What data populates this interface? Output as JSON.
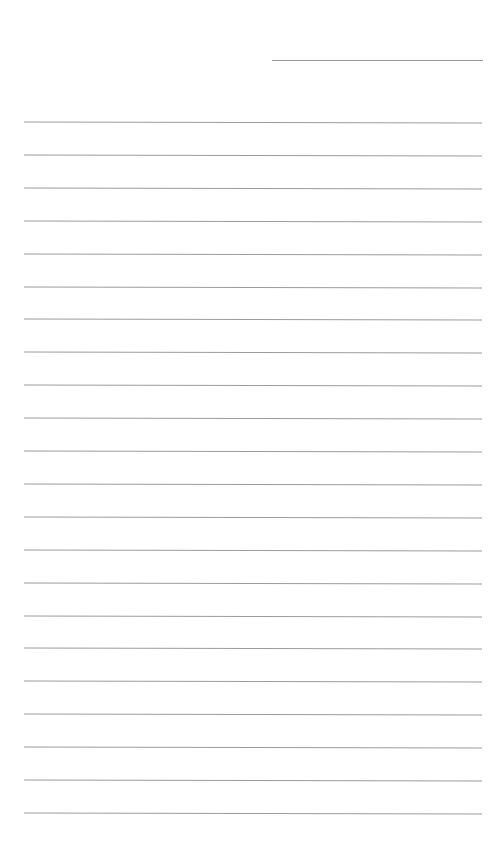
{
  "page": {
    "type": "blank lined paper",
    "background_color": "#ffffff",
    "line_color": "#9c9c9c",
    "header_field": {
      "value": ""
    },
    "ruled_lines": {
      "count": 22,
      "first_y": 122,
      "spacing": 32.9,
      "left": 24,
      "width": 458
    }
  }
}
